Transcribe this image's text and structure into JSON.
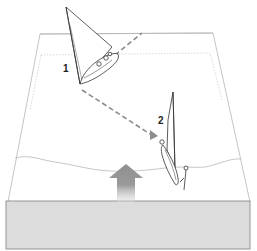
{
  "diagram": {
    "labels": [
      {
        "id": "position-1",
        "text": "1"
      },
      {
        "id": "position-2",
        "text": "2"
      }
    ],
    "elements": {
      "water_block": "cross-section of water body in perspective",
      "sea_surface_line": "wavy surface line",
      "wave_arrow": "upward gray arrow (wave/swell direction)",
      "path_line": "dashed gray trajectory from boat 1 to boat 2",
      "boat_1": "heeled sailboat with crew, position 1",
      "boat_2": "knocked-down sailboat with crew, position 2"
    },
    "colors": {
      "line": "#9a9a9a",
      "dashed_path": "#8c8c8c",
      "arrow": "#8f8f8f",
      "water_front": "#dcdcdc",
      "ink": "#333333"
    }
  }
}
